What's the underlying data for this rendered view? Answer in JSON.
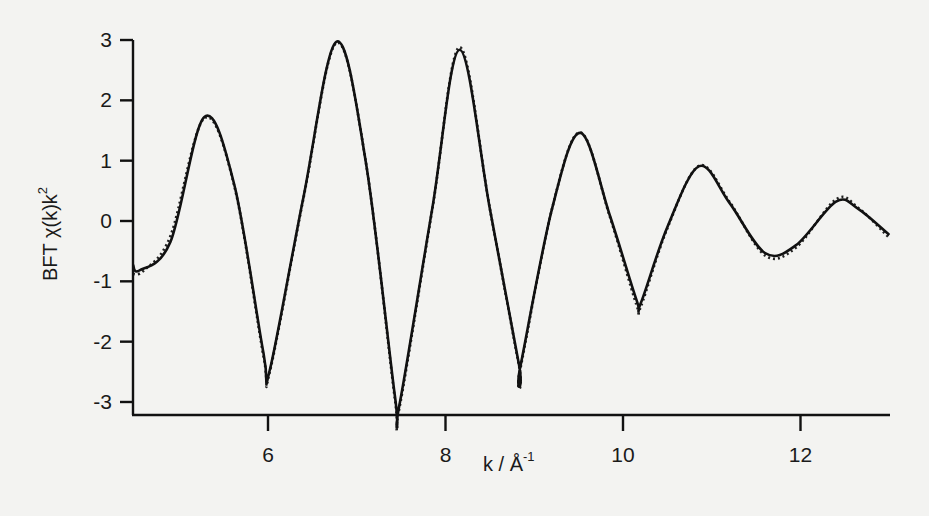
{
  "chart_data": {
    "type": "line",
    "title": "",
    "xlabel": "k / Å⁻¹",
    "xlabel_main": "k / Å",
    "xlabel_sup": "-1",
    "ylabel": "BFT χ(k)k²",
    "ylabel_main": "BFT χ(k)k",
    "ylabel_sup": "2",
    "xlim": [
      4.48,
      13.0
    ],
    "ylim": [
      -3.05,
      3.0
    ],
    "x_ticks": [
      6,
      8,
      10,
      12
    ],
    "x_tick_labels": [
      "6",
      "8",
      "10",
      "12"
    ],
    "y_ticks": [
      3,
      2,
      1,
      0,
      -1,
      -2,
      -3
    ],
    "y_tick_labels": [
      "3",
      "2",
      "1",
      "0",
      "-1",
      "-2",
      "-3"
    ],
    "grid": false,
    "legend": null,
    "series": [
      {
        "name": "experimental",
        "style": "solid",
        "x": [
          4.48,
          4.55,
          4.9,
          5.28,
          5.62,
          5.95,
          6.02,
          6.4,
          6.77,
          7.1,
          7.43,
          7.48,
          7.85,
          8.16,
          8.5,
          8.83,
          8.84,
          9.2,
          9.52,
          9.85,
          10.15,
          10.2,
          10.5,
          10.86,
          11.2,
          11.6,
          11.95,
          12.4,
          12.65,
          13.0
        ],
        "y": [
          -0.73,
          -0.82,
          -0.35,
          1.72,
          0.6,
          -2.2,
          -2.47,
          0.4,
          2.97,
          1.0,
          -2.9,
          -3.05,
          0.2,
          2.84,
          0.2,
          -2.4,
          -2.44,
          0.2,
          1.46,
          0.1,
          -1.3,
          -1.36,
          -0.1,
          0.91,
          0.3,
          -0.53,
          -0.4,
          0.32,
          0.2,
          -0.23
        ]
      },
      {
        "name": "fit",
        "style": "dotted",
        "x": [
          4.48,
          4.6,
          4.9,
          5.28,
          5.62,
          5.95,
          6.02,
          6.4,
          6.77,
          7.1,
          7.43,
          7.48,
          7.85,
          8.16,
          8.5,
          8.83,
          8.84,
          9.2,
          9.52,
          9.85,
          10.15,
          10.2,
          10.5,
          10.86,
          11.2,
          11.6,
          11.95,
          12.4,
          12.65,
          13.0
        ],
        "y": [
          -0.88,
          -0.82,
          -0.25,
          1.7,
          0.58,
          -2.25,
          -2.5,
          0.38,
          2.95,
          1.0,
          -2.95,
          -3.1,
          0.18,
          2.88,
          0.2,
          -2.42,
          -2.48,
          0.2,
          1.47,
          0.08,
          -1.38,
          -1.42,
          -0.12,
          0.92,
          0.32,
          -0.57,
          -0.44,
          0.36,
          0.22,
          -0.28
        ]
      }
    ]
  }
}
